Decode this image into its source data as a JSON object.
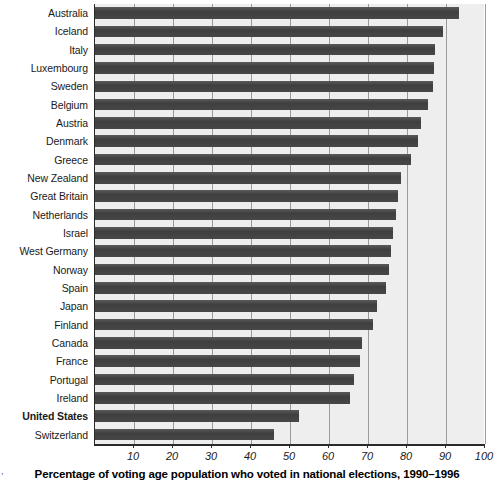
{
  "chart_data": {
    "type": "bar",
    "orientation": "horizontal",
    "title": "",
    "xlabel": "Percentage of voting age population who voted in national elections, 1990–1996",
    "ylabel": "",
    "xlim": [
      0,
      100
    ],
    "xticks": [
      10,
      20,
      30,
      40,
      50,
      60,
      70,
      80,
      90,
      100
    ],
    "grid": true,
    "legend": "none",
    "bar_color": "#474747",
    "plot_background": "#eeeeee",
    "highlight_category": "United States",
    "categories": [
      "Australia",
      "Iceland",
      "Italy",
      "Luxembourg",
      "Sweden",
      "Belgium",
      "Austria",
      "Denmark",
      "Greece",
      "New Zealand",
      "Great Britain",
      "Netherlands",
      "Israel",
      "West Germany",
      "Norway",
      "Spain",
      "Japan",
      "Finland",
      "Canada",
      "France",
      "Portugal",
      "Ireland",
      "United States",
      "Switzerland"
    ],
    "values": [
      93.4,
      89.3,
      87.2,
      86.9,
      86.6,
      85.5,
      83.7,
      82.9,
      81.0,
      78.5,
      77.8,
      77.2,
      76.4,
      76.0,
      75.4,
      74.6,
      72.2,
      71.4,
      68.4,
      68.0,
      66.5,
      65.4,
      52.4,
      45.8
    ],
    "corner_note": ","
  }
}
